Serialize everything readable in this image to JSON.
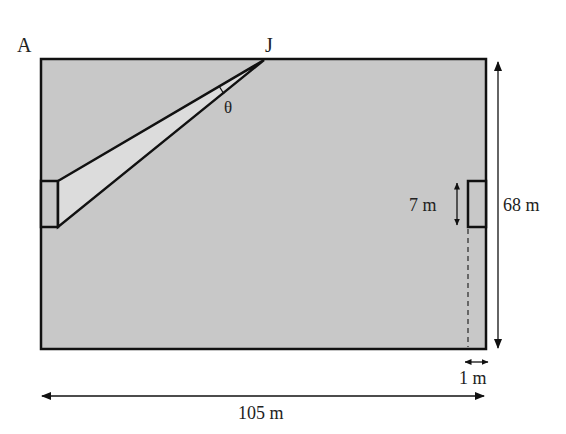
{
  "diagram": {
    "labels": {
      "corner": "A",
      "point": "J",
      "angle": "θ",
      "goal_width": "7 m",
      "pitch_width": "68 m",
      "pitch_length": "105 m",
      "offset": "1 m"
    },
    "colors": {
      "pitch_fill": "#c8c8c8",
      "wedge_fill": "#dcdcdc",
      "stroke": "#111111"
    }
  }
}
